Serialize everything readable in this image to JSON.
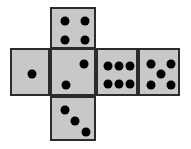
{
  "figure": {
    "kind": "dice-cube-net",
    "background_color": "#ffffff",
    "face_fill_color": "#c8c8c8",
    "face_border_color": "#2b2b2b",
    "pip_color": "#000000",
    "pip_diameter": 9
  },
  "faces": [
    {
      "name": "top-face",
      "label": "4",
      "value": 4,
      "x": 50,
      "y": 7,
      "width": 46,
      "height": 42,
      "pip_layout": "four-corners",
      "pips": [
        {
          "x": 13,
          "y": 12
        },
        {
          "x": 33,
          "y": 12
        },
        {
          "x": 13,
          "y": 31
        },
        {
          "x": 33,
          "y": 31
        }
      ]
    },
    {
      "name": "left-face",
      "label": "1",
      "value": 1,
      "x": 10,
      "y": 48,
      "width": 40,
      "height": 48,
      "pip_layout": "center",
      "pips": [
        {
          "x": 20,
          "y": 24
        }
      ]
    },
    {
      "name": "center-face",
      "label": "2",
      "value": 2,
      "x": 50,
      "y": 48,
      "width": 46,
      "height": 48,
      "pip_layout": "diagonal-up",
      "pips": [
        {
          "x": 32,
          "y": 14
        },
        {
          "x": 14,
          "y": 35
        }
      ]
    },
    {
      "name": "right-face",
      "label": "6",
      "value": 6,
      "x": 96,
      "y": 48,
      "width": 42,
      "height": 48,
      "pip_layout": "two-rows-of-three",
      "pips": [
        {
          "x": 10,
          "y": 16
        },
        {
          "x": 21,
          "y": 16
        },
        {
          "x": 32,
          "y": 16
        },
        {
          "x": 10,
          "y": 34
        },
        {
          "x": 21,
          "y": 34
        },
        {
          "x": 32,
          "y": 34
        }
      ]
    },
    {
      "name": "far-right-face",
      "label": "5",
      "value": 5,
      "x": 138,
      "y": 48,
      "width": 42,
      "height": 48,
      "pip_layout": "four-corners-plus-center",
      "pips": [
        {
          "x": 11,
          "y": 14
        },
        {
          "x": 31,
          "y": 14
        },
        {
          "x": 21,
          "y": 24
        },
        {
          "x": 11,
          "y": 35
        },
        {
          "x": 31,
          "y": 35
        }
      ]
    },
    {
      "name": "bottom-face",
      "label": "3",
      "value": 3,
      "x": 50,
      "y": 96,
      "width": 46,
      "height": 45,
      "pip_layout": "diagonal-down",
      "pips": [
        {
          "x": 13,
          "y": 12
        },
        {
          "x": 23,
          "y": 23
        },
        {
          "x": 34,
          "y": 34
        }
      ]
    }
  ]
}
